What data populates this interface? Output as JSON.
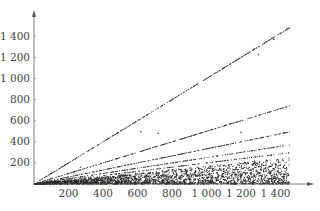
{
  "chart_data": {
    "type": "scatter",
    "title": "",
    "xlabel": "",
    "ylabel": "",
    "xlim": [
      0,
      1500
    ],
    "ylim": [
      0,
      1550
    ],
    "grid": false,
    "legend": null,
    "x_ticks": [
      200,
      400,
      600,
      800,
      1000,
      1200,
      1400
    ],
    "x_tick_labels": [
      "200",
      "400",
      "600",
      "800",
      "1 000",
      "1 200",
      "1 400"
    ],
    "y_ticks": [
      200,
      400,
      600,
      800,
      1000,
      1200,
      1400
    ],
    "y_tick_labels": [
      "200",
      "400",
      "600",
      "800",
      "1 000",
      "1 200",
      "1 400"
    ],
    "series": [
      {
        "name": "ray slope 1",
        "slope": 1.0,
        "x_range": [
          1,
          1480
        ],
        "density": 0.55
      },
      {
        "name": "ray slope 1/2",
        "slope": 0.5,
        "x_range": [
          1,
          1480
        ],
        "density": 0.5
      },
      {
        "name": "ray slope 1/3",
        "slope": 0.3333,
        "x_range": [
          1,
          1480
        ],
        "density": 0.45
      },
      {
        "name": "ray slope 1/4",
        "slope": 0.25,
        "x_range": [
          1,
          1480
        ],
        "density": 0.4
      },
      {
        "name": "ray slope 1/5",
        "slope": 0.2,
        "x_range": [
          1,
          1480
        ],
        "density": 0.35
      },
      {
        "name": "cloud",
        "max_slope": 0.17,
        "x_range": [
          1,
          1480
        ],
        "count": 2600
      }
    ],
    "outliers": [
      [
        620,
        495
      ],
      [
        720,
        480
      ],
      [
        1200,
        490
      ],
      [
        1300,
        1225
      ],
      [
        1390,
        1370
      ],
      [
        270,
        160
      ]
    ]
  }
}
